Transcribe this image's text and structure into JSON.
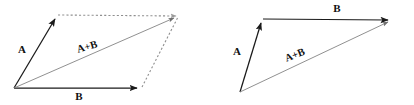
{
  "figure": {
    "background_color": "#ffffff",
    "width": 414,
    "height": 105,
    "colors": {
      "solid_stroke": "#1a1a1a",
      "sum_stroke": "#8a8a8a",
      "dashed_stroke": "#8a8a8a",
      "label_fill": "#111111"
    }
  },
  "diagrams": [
    {
      "id": "parallelogram-rule",
      "name": "parallelogram-method-diagram",
      "labels": {
        "vector_a": "A",
        "vector_b": "B",
        "vector_sum": "A+B"
      },
      "label_positions": {
        "vector_a": {
          "x": 22,
          "y": 53,
          "rotation": 0
        },
        "vector_b": {
          "x": 79,
          "y": 100,
          "rotation": 0
        },
        "vector_sum": {
          "x": 88,
          "y": 50,
          "rotation": -16
        }
      },
      "points": {
        "origin": {
          "x": 14,
          "y": 88
        },
        "a_tip": {
          "x": 57,
          "y": 15
        },
        "b_tip": {
          "x": 141,
          "y": 88
        },
        "sum_tip": {
          "x": 178,
          "y": 16
        }
      },
      "edges": [
        {
          "name": "vector-a-arrow",
          "style": "solid-arrow",
          "from": "origin",
          "to": "a_tip"
        },
        {
          "name": "vector-b-arrow",
          "style": "solid-arrow",
          "from": "origin",
          "to": "b_tip"
        },
        {
          "name": "vector-sum-arrow",
          "style": "thin-arrow",
          "from": "origin",
          "to": "sum_tip"
        },
        {
          "name": "construction-line-top",
          "style": "dotted",
          "from": "a_tip",
          "to": "sum_tip"
        },
        {
          "name": "construction-line-right",
          "style": "dotted",
          "from": "b_tip",
          "to": "sum_tip"
        }
      ]
    },
    {
      "id": "triangle-rule",
      "name": "head-to-tail-method-diagram",
      "labels": {
        "vector_a": "A",
        "vector_b": "B",
        "vector_sum": "A+B"
      },
      "label_positions": {
        "vector_a": {
          "x": 237,
          "y": 55,
          "rotation": 0
        },
        "vector_b": {
          "x": 337,
          "y": 12,
          "rotation": 0
        },
        "vector_sum": {
          "x": 296,
          "y": 58,
          "rotation": -21
        }
      },
      "points": {
        "origin": {
          "x": 240,
          "y": 92
        },
        "a_tip": {
          "x": 263,
          "y": 19
        },
        "b_tip": {
          "x": 392,
          "y": 20
        }
      },
      "edges": [
        {
          "name": "vector-a-arrow",
          "style": "solid-arrow",
          "from": "origin",
          "to": "a_tip"
        },
        {
          "name": "vector-b-arrow",
          "style": "solid-arrow",
          "from": "a_tip",
          "to": "b_tip"
        },
        {
          "name": "vector-sum-arrow",
          "style": "thin-arrow",
          "from": "origin",
          "to": "b_tip"
        }
      ]
    }
  ]
}
